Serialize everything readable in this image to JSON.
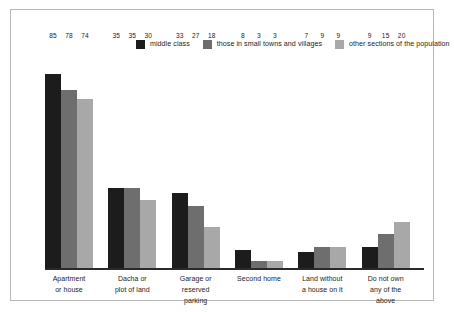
{
  "chart_data": {
    "type": "bar",
    "title": "",
    "subtitle": "",
    "xlabel": "",
    "ylabel": "",
    "ylim": [
      0,
      100
    ],
    "grid": false,
    "legend_position": "top",
    "categories": [
      "Apartment or house",
      "Dacha or plot of land",
      "Garage or reserved parking",
      "Second home",
      "Land without a house on it",
      "Do not own any of the above"
    ],
    "category_lines": [
      [
        "Apartment",
        "or house"
      ],
      [
        "Dacha or",
        "plot of land"
      ],
      [
        "Garage or",
        "reserved parking"
      ],
      [
        "Second home"
      ],
      [
        "Land without",
        "a house on it"
      ],
      [
        "Do not own",
        "any of the above"
      ]
    ],
    "series": [
      {
        "name": "middle class",
        "color": "#1c1c1c",
        "values": [
          85,
          35,
          33,
          8,
          7,
          9
        ]
      },
      {
        "name": "those in small towns and villages",
        "color": "#6e6e6e",
        "values": [
          78,
          35,
          27,
          3,
          9,
          15
        ]
      },
      {
        "name": "other sections of the population",
        "color": "#a8a8a8",
        "values": [
          74,
          30,
          18,
          3,
          9,
          20
        ]
      }
    ]
  },
  "legend": {
    "items": [
      {
        "label": "middle class",
        "color": "#1c1c1c"
      },
      {
        "label": "those in small towns and villages",
        "color": "#6e6e6e"
      },
      {
        "label": "other sections of the population",
        "color": "#a8a8a8"
      }
    ]
  },
  "style": {
    "frame_border": "#b9b9b9",
    "axis_color": "#2a2a2a",
    "background": "#ffffff",
    "text_color": "#1c1c1c"
  }
}
